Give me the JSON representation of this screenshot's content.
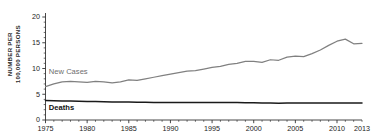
{
  "chart_data": {
    "type": "line",
    "title": "",
    "xlabel": "",
    "ylabel": "NUMBER PER\n100,000 PERSONS",
    "ylim": [
      0,
      20
    ],
    "yticks": [
      0,
      5,
      10,
      15,
      20
    ],
    "ytick_labels": [
      "0",
      "5",
      "10",
      "15",
      "20"
    ],
    "xlim": [
      1975,
      2013
    ],
    "xticks": [
      1975,
      1980,
      1985,
      1990,
      1995,
      2000,
      2005,
      2010,
      2013
    ],
    "xtick_labels": [
      "1975",
      "1980",
      "1985",
      "1990",
      "1995",
      "2000",
      "2005",
      "2010",
      "2013"
    ],
    "grid": false,
    "legend_position": "inline-annotation",
    "x": [
      1975,
      1976,
      1977,
      1978,
      1979,
      1980,
      1981,
      1982,
      1983,
      1984,
      1985,
      1986,
      1987,
      1988,
      1989,
      1990,
      1991,
      1992,
      1993,
      1994,
      1995,
      1996,
      1997,
      1998,
      1999,
      2000,
      2001,
      2002,
      2003,
      2004,
      2005,
      2006,
      2007,
      2008,
      2009,
      2010,
      2011,
      2012,
      2013
    ],
    "series": [
      {
        "name": "New Cases",
        "color": "#808080",
        "values": [
          6.5,
          7.0,
          7.4,
          7.5,
          7.4,
          7.3,
          7.5,
          7.4,
          7.2,
          7.4,
          7.8,
          7.7,
          8.0,
          8.3,
          8.6,
          8.9,
          9.2,
          9.5,
          9.6,
          9.9,
          10.2,
          10.4,
          10.8,
          11.0,
          11.4,
          11.4,
          11.2,
          11.7,
          11.6,
          12.2,
          12.4,
          12.3,
          12.9,
          13.6,
          14.5,
          15.3,
          15.7,
          14.8,
          14.9
        ]
      },
      {
        "name": "Deaths",
        "color": "#1a1a1a",
        "values": [
          3.8,
          3.75,
          3.7,
          3.7,
          3.65,
          3.6,
          3.6,
          3.55,
          3.5,
          3.5,
          3.5,
          3.45,
          3.45,
          3.4,
          3.4,
          3.4,
          3.4,
          3.4,
          3.4,
          3.4,
          3.4,
          3.4,
          3.4,
          3.4,
          3.35,
          3.35,
          3.3,
          3.3,
          3.25,
          3.3,
          3.3,
          3.3,
          3.3,
          3.3,
          3.3,
          3.3,
          3.3,
          3.3,
          3.3
        ]
      }
    ],
    "annotations": [
      {
        "name": "new-cases-label",
        "text": "New Cases"
      },
      {
        "name": "deaths-label",
        "text": "Deaths"
      }
    ]
  },
  "colors": {
    "new_cases": "#808080",
    "deaths": "#1a1a1a",
    "axis": "#333333",
    "background": "#ffffff"
  }
}
